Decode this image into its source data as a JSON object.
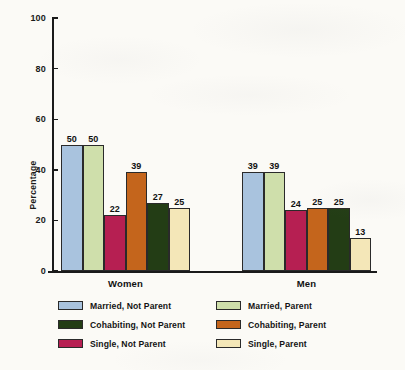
{
  "chart_data": {
    "type": "bar",
    "title": "",
    "xlabel": "",
    "ylabel": "Percentage",
    "ylim": [
      0,
      100
    ],
    "yticks": [
      0,
      20,
      40,
      60,
      80,
      100
    ],
    "grid": false,
    "legend_position": "bottom",
    "categories": [
      "Women",
      "Men"
    ],
    "series": [
      {
        "name": "Married, Not Parent",
        "color": "#a9c3de",
        "values": [
          50,
          39
        ]
      },
      {
        "name": "Married, Parent",
        "color": "#cfdfab",
        "values": [
          50,
          39
        ]
      },
      {
        "name": "Single, Not Parent",
        "color": "#b61f52",
        "values": [
          22,
          24
        ]
      },
      {
        "name": "Cohabiting, Parent",
        "color": "#c4651c",
        "values": [
          39,
          25
        ]
      },
      {
        "name": "Cohabiting, Not Parent",
        "color": "#233d15",
        "values": [
          27,
          25
        ]
      },
      {
        "name": "Single, Parent",
        "color": "#f4e7b8",
        "values": [
          25,
          13
        ]
      }
    ],
    "bar_order": [
      "Married, Not Parent",
      "Married, Parent",
      "Single, Not Parent",
      "Cohabiting, Parent",
      "Cohabiting, Not Parent",
      "Single, Parent"
    ],
    "data_labels": {
      "Women": [
        "50",
        "50",
        "22",
        "39",
        "27",
        "25"
      ],
      "Men": [
        "39",
        "39",
        "24",
        "25",
        "25",
        "13"
      ]
    }
  },
  "axis": {
    "y_title": "Percentage",
    "y_tick_labels": [
      "0",
      "20",
      "40",
      "60",
      "80",
      "100"
    ],
    "x_tick_labels": [
      "Women",
      "Men"
    ]
  },
  "legend": {
    "items": [
      {
        "label": "Married, Not Parent",
        "color": "#a9c3de"
      },
      {
        "label": "Married, Parent",
        "color": "#cfdfab"
      },
      {
        "label": "Cohabiting, Not Parent",
        "color": "#233d15"
      },
      {
        "label": "Cohabiting, Parent",
        "color": "#c4651c"
      },
      {
        "label": "Single, Not Parent",
        "color": "#b61f52"
      },
      {
        "label": "Single, Parent",
        "color": "#f4e7b8"
      }
    ]
  },
  "colors": {
    "axis": "#1a1a1a",
    "text": "#111111",
    "background": "#fbfaf6"
  }
}
